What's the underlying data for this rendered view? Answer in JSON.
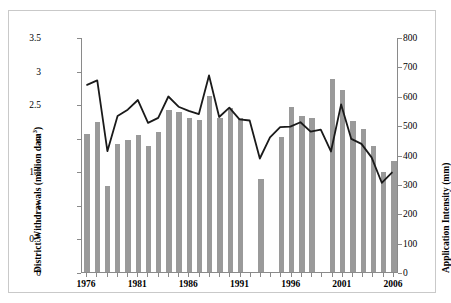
{
  "chart_data": {
    "type": "bar",
    "title": "",
    "xlabel": "",
    "ylabel": "District Withdrawals (million dam3)",
    "ylabel_right": "Application Intensity (mm)",
    "grid": false,
    "legend": "none",
    "ylim": [
      0,
      3.5
    ],
    "ylim_right": [
      0,
      800
    ],
    "ytick_labels": [
      "3.5",
      "3",
      "2.5",
      "2",
      "1.5",
      "1",
      "0.5",
      "0"
    ],
    "ytick_values": [
      3.5,
      3,
      2.5,
      2,
      1.5,
      1,
      0.5,
      0
    ],
    "ytick_labels_right": [
      "800",
      "700",
      "600",
      "500",
      "400",
      "300",
      "200",
      "100",
      "0"
    ],
    "ytick_values_right": [
      800,
      700,
      600,
      500,
      400,
      300,
      200,
      100,
      0
    ],
    "categories": [
      1976,
      1977,
      1978,
      1979,
      1980,
      1981,
      1982,
      1983,
      1984,
      1985,
      1986,
      1987,
      1988,
      1989,
      1990,
      1991,
      1992,
      1993,
      1994,
      1995,
      1996,
      1997,
      1998,
      1999,
      2000,
      2001,
      2002,
      2003,
      2004,
      2005,
      2006
    ],
    "xtick_labels": [
      "1976",
      "1981",
      "1986",
      "1991",
      "1996",
      "2001",
      "2006"
    ],
    "xtick_values": [
      1976,
      1981,
      1986,
      1991,
      1996,
      2001,
      2006
    ],
    "series": [
      {
        "name": "District Withdrawals",
        "type": "bar",
        "axis": "left",
        "unit": "million dam3",
        "color": "#9a9a9a",
        "values": [
          2.06,
          2.24,
          1.28,
          1.9,
          1.96,
          2.04,
          1.87,
          2.09,
          2.42,
          2.39,
          2.29,
          2.27,
          2.62,
          2.3,
          2.44,
          2.29,
          null,
          1.38,
          null,
          2.01,
          2.46,
          2.32,
          2.3,
          null,
          2.87,
          2.71,
          2.25,
          2.13,
          1.88,
          1.49,
          1.66
        ]
      },
      {
        "name": "Application Intensity",
        "type": "line",
        "axis": "right",
        "unit": "mm",
        "color": "#1a1a1a",
        "values": [
          640,
          655,
          413,
          533,
          555,
          588,
          510,
          527,
          600,
          565,
          551,
          540,
          672,
          530,
          562,
          522,
          518,
          388,
          460,
          495,
          497,
          512,
          480,
          487,
          412,
          573,
          455,
          438,
          392,
          305,
          340
        ]
      }
    ]
  },
  "axis_titles": {
    "left_main": "District Withdrawals (million dam",
    "left_sup": "3",
    "left_close": ")",
    "right": "Application Intensity (mm)"
  }
}
